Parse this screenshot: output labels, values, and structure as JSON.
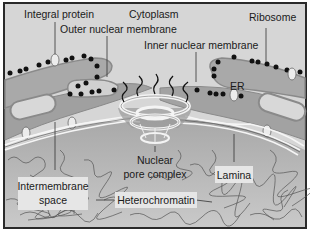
{
  "diagram": {
    "colors": {
      "frame": "#2a2a2a",
      "cytoplasm": "#d4d4d4",
      "er_lumen": "#a9a9a9",
      "membrane_edge": "#8a8a8a",
      "nucleoplasm": "#b8b8b8",
      "ribosome": "#111111",
      "lamina": "#f2f2f2",
      "chromatin_line": "#555555",
      "label_box": "#e6e6e6"
    },
    "labels": {
      "cytoplasm": "Cytoplasm",
      "integral_protein": "Integral protein",
      "outer_nuclear_membrane": "Outer nuclear membrane",
      "inner_nuclear_membrane": "Inner nuclear membrane",
      "ribosome": "Ribosome",
      "er": "ER",
      "intermembrane_space_line1": "Intermembrane",
      "intermembrane_space_line2": "space",
      "nuclear_pore_complex_line1": "Nuclear",
      "nuclear_pore_complex_line2": "pore complex",
      "lamina": "Lamina",
      "heterochromatin": "Heterochromatin"
    }
  }
}
